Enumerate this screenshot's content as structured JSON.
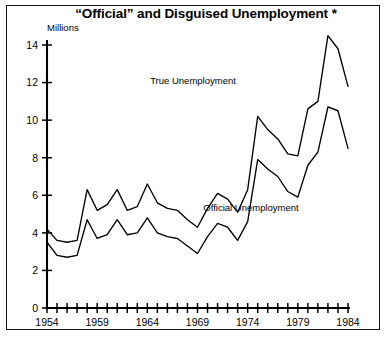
{
  "chart_data": {
    "type": "line",
    "title": "“Official” and Disguised Unemployment *",
    "ylabel": "Millions",
    "xlabel": "",
    "xlim": [
      1954,
      1984
    ],
    "ylim": [
      0,
      15
    ],
    "grid": false,
    "legend_position": "inline-annotations",
    "y_ticks": [
      0,
      2,
      4,
      6,
      8,
      10,
      12,
      14
    ],
    "y_tick_labels": [
      "0",
      "2",
      "4",
      "6",
      "8",
      "10",
      "12",
      "14"
    ],
    "x_ticks": [
      1954,
      1955,
      1956,
      1957,
      1958,
      1959,
      1960,
      1961,
      1962,
      1963,
      1964,
      1965,
      1966,
      1967,
      1968,
      1969,
      1970,
      1971,
      1972,
      1973,
      1974,
      1975,
      1976,
      1977,
      1978,
      1979,
      1980,
      1981,
      1982,
      1983,
      1984
    ],
    "x_tick_labels": [
      "1954",
      "1959",
      "1964",
      "1969",
      "1974",
      "1979",
      "1984"
    ],
    "x_labeled_ticks": [
      1954,
      1959,
      1964,
      1969,
      1974,
      1979,
      1984
    ],
    "x": [
      1954,
      1955,
      1956,
      1957,
      1958,
      1959,
      1960,
      1961,
      1962,
      1963,
      1964,
      1965,
      1966,
      1967,
      1968,
      1969,
      1970,
      1971,
      1972,
      1973,
      1974,
      1975,
      1976,
      1977,
      1978,
      1979,
      1980,
      1981,
      1982,
      1983,
      1984
    ],
    "series": [
      {
        "name": "True Unemployment",
        "label": "True Unemployment",
        "color": "#000000",
        "values": [
          4.2,
          3.6,
          3.5,
          3.6,
          6.3,
          5.2,
          5.5,
          6.3,
          5.2,
          5.4,
          6.6,
          5.6,
          5.3,
          5.2,
          4.7,
          4.3,
          5.3,
          6.1,
          5.8,
          5.1,
          6.3,
          10.2,
          9.5,
          9.0,
          8.2,
          8.1,
          10.6,
          11.0,
          14.5,
          13.8,
          11.8
        ]
      },
      {
        "name": "Official Unemployment",
        "label": "Official Unemployment",
        "color": "#000000",
        "values": [
          3.5,
          2.8,
          2.7,
          2.8,
          4.7,
          3.7,
          3.9,
          4.7,
          3.9,
          4.0,
          4.8,
          4.0,
          3.8,
          3.7,
          3.3,
          2.9,
          3.8,
          4.5,
          4.3,
          3.6,
          4.6,
          7.9,
          7.4,
          7.0,
          6.2,
          5.9,
          7.6,
          8.3,
          10.7,
          10.5,
          8.5
        ]
      }
    ],
    "annotations": [
      {
        "name": "true-unemployment-label",
        "text": "True Unemployment",
        "x_px": 193,
        "y_px": 84
      },
      {
        "name": "official-unemployment-label",
        "text": "Official Unemployment",
        "x_px": 251,
        "y_px": 211
      }
    ]
  }
}
